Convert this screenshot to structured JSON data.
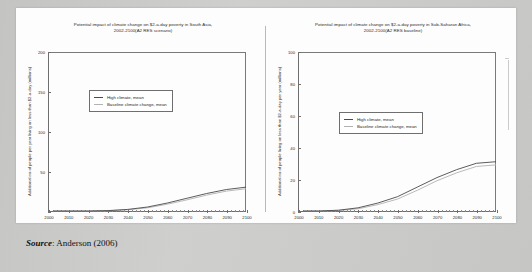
{
  "source_caption": {
    "label": "Source",
    "separator": ":",
    "text": "Anderson (2006)"
  },
  "legend": {
    "high_label": "High climate, mean",
    "baseline_label": "Baseline climate  change, mean",
    "high_color": "#4a4a4a",
    "baseline_color": "#b2b2b2"
  },
  "chart_data": [
    {
      "type": "line",
      "id": "south-asia",
      "title_line1": "Potential impact of climate change on $2-a-day poverty in South Asia,",
      "title_line2": "2002-2100(A2 RES scenario)",
      "xlabel": "",
      "ylabel": "Additional no of people per year living on less than $2-a-day (millions)",
      "xlim": [
        2000,
        2100
      ],
      "ylim": [
        0,
        200
      ],
      "yticks": [
        0,
        50,
        100,
        150,
        200
      ],
      "ytick_labels": [
        "",
        "50",
        "100",
        "150",
        "200"
      ],
      "xticks": [
        2000,
        2010,
        2020,
        2030,
        2040,
        2050,
        2060,
        2070,
        2080,
        2090,
        2100
      ],
      "xtick_labels": [
        "2000",
        "2010",
        "2020",
        "2030",
        "2040",
        "2050",
        "2060",
        "2070",
        "2080",
        "2090",
        "2100"
      ],
      "grid": false,
      "legend_position": "upper-left-inset",
      "series": [
        {
          "name": "High climate, mean",
          "color": "#4a4a4a",
          "x": [
            2002,
            2010,
            2020,
            2030,
            2040,
            2050,
            2060,
            2070,
            2080,
            2090,
            2100
          ],
          "values": [
            0,
            0,
            0,
            0.5,
            2,
            5,
            10,
            16,
            22,
            27,
            30
          ]
        },
        {
          "name": "Baseline climate  change, mean",
          "color": "#b2b2b2",
          "x": [
            2002,
            2010,
            2020,
            2030,
            2040,
            2050,
            2060,
            2070,
            2080,
            2090,
            2100
          ],
          "values": [
            0,
            0,
            0,
            0.3,
            1.5,
            4,
            8.5,
            14,
            20,
            25,
            28
          ]
        }
      ]
    },
    {
      "type": "line",
      "id": "sub-saharan-africa",
      "title_line1": "Potential impact of climate change on $2-a-day poverty in Sub-Saharan Africa,",
      "title_line2": "2002-2100(A2 RES baseline)",
      "xlabel": "",
      "ylabel": "Additional no of people living on less than $2-a-day per year (millions)",
      "xlim": [
        2000,
        2100
      ],
      "ylim": [
        0,
        100
      ],
      "yticks": [
        0,
        20,
        40,
        60,
        80,
        100
      ],
      "ytick_labels": [
        "0",
        "20",
        "40",
        "60",
        "80",
        "100"
      ],
      "xticks": [
        2000,
        2010,
        2020,
        2030,
        2040,
        2050,
        2060,
        2070,
        2080,
        2090,
        2100
      ],
      "xtick_labels": [
        "2000",
        "2010",
        "2020",
        "2030",
        "2040",
        "2050",
        "2060",
        "2070",
        "2080",
        "2090",
        "2100"
      ],
      "grid": false,
      "legend_position": "upper-left-inset",
      "series": [
        {
          "name": "High climate, mean",
          "color": "#4a4a4a",
          "x": [
            2002,
            2010,
            2020,
            2030,
            2040,
            2050,
            2060,
            2070,
            2080,
            2090,
            2100
          ],
          "values": [
            0,
            0,
            0.5,
            2,
            5,
            9,
            15,
            21,
            26,
            30,
            31
          ]
        },
        {
          "name": "Baseline climate  change, mean",
          "color": "#b2b2b2",
          "x": [
            2002,
            2010,
            2020,
            2030,
            2040,
            2050,
            2060,
            2070,
            2080,
            2090,
            2100
          ],
          "values": [
            0,
            0,
            0.3,
            1.4,
            4,
            7.5,
            13,
            19,
            24,
            28,
            29
          ]
        }
      ]
    }
  ]
}
